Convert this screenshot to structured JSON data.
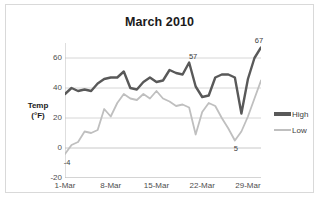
{
  "chart_data": {
    "type": "line",
    "title": "March 2010",
    "xlabel": "",
    "ylabel": "Temp (°F)",
    "ylabel_line1": "Temp",
    "ylabel_line2": "(°F)",
    "ylim": [
      -20,
      70
    ],
    "yticks": [
      -20,
      0,
      20,
      40,
      60
    ],
    "ytick_labels": [
      "-20",
      "0",
      "20",
      "40",
      "60"
    ],
    "grid": true,
    "legend_position": "right",
    "x": [
      1,
      2,
      3,
      4,
      5,
      6,
      7,
      8,
      9,
      10,
      11,
      12,
      13,
      14,
      15,
      16,
      17,
      18,
      19,
      20,
      21,
      22,
      23,
      24,
      25,
      26,
      27,
      28,
      29,
      30,
      31
    ],
    "xtick_positions": [
      1,
      8,
      15,
      22,
      29
    ],
    "xtick_labels": [
      "1-Mar",
      "8-Mar",
      "15-Mar",
      "22-Mar",
      "29-Mar"
    ],
    "series": [
      {
        "name": "High",
        "color": "#595959",
        "values": [
          36,
          40,
          38,
          39,
          38,
          43,
          46,
          47,
          47,
          51,
          40,
          39,
          44,
          47,
          44,
          45,
          52,
          50,
          49,
          57,
          41,
          34,
          35,
          47,
          49,
          49,
          47,
          23,
          46,
          60,
          67
        ]
      },
      {
        "name": "Low",
        "color": "#bfbfbf",
        "values": [
          -4,
          2,
          4,
          11,
          10,
          12,
          26,
          21,
          30,
          36,
          33,
          32,
          36,
          33,
          38,
          33,
          31,
          28,
          29,
          27,
          9,
          24,
          30,
          28,
          20,
          13,
          5,
          11,
          21,
          33,
          45
        ]
      }
    ],
    "annotations": [
      {
        "text": "57",
        "series": "High",
        "x": 20,
        "y": 57
      },
      {
        "text": "67",
        "series": "High",
        "x": 31,
        "y": 67
      },
      {
        "text": "-4",
        "series": "Low",
        "x": 1,
        "y": -4
      },
      {
        "text": "5",
        "series": "Low",
        "x": 27,
        "y": 5
      }
    ]
  },
  "legend": {
    "items": [
      {
        "label": "High"
      },
      {
        "label": "Low"
      }
    ]
  }
}
